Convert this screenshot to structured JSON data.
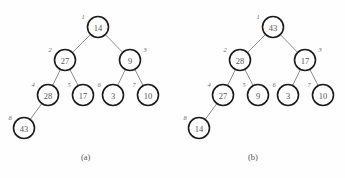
{
  "figure": {
    "background_color": "#fefefe",
    "node_fill": "#fdfdfd",
    "node_stroke": "#1c1c1c",
    "edge_color": "#8e8e8e",
    "value_color": "#585858",
    "index_color": "#6a6a6a"
  },
  "panels": [
    {
      "caption": "(a)",
      "caption_x": 81,
      "caption_y": 152,
      "nodes": [
        {
          "index": "1",
          "value": "14",
          "cx": 98,
          "cy": 27,
          "r": 10.5,
          "ix": 83,
          "iy": 16
        },
        {
          "index": "2",
          "value": "27",
          "cx": 65,
          "cy": 60,
          "r": 10.5,
          "ix": 50,
          "iy": 49
        },
        {
          "index": "3",
          "value": "9",
          "cx": 130,
          "cy": 60,
          "r": 10.5,
          "ix": 145,
          "iy": 49
        },
        {
          "index": "4",
          "value": "28",
          "cx": 48,
          "cy": 95,
          "r": 10.5,
          "ix": 33,
          "iy": 84
        },
        {
          "index": "5",
          "value": "17",
          "cx": 83,
          "cy": 95,
          "r": 10.5,
          "ix": 69,
          "iy": 84
        },
        {
          "index": "6",
          "value": "3",
          "cx": 113,
          "cy": 95,
          "r": 10.5,
          "ix": 99,
          "iy": 84
        },
        {
          "index": "7",
          "value": "10",
          "cx": 148,
          "cy": 95,
          "r": 10.5,
          "ix": 134,
          "iy": 84
        },
        {
          "index": "8",
          "value": "43",
          "cx": 24,
          "cy": 128,
          "r": 10.5,
          "ix": 10,
          "iy": 117
        }
      ],
      "edges": [
        {
          "x1": 98,
          "y1": 27,
          "x2": 65,
          "y2": 60
        },
        {
          "x1": 98,
          "y1": 27,
          "x2": 130,
          "y2": 60
        },
        {
          "x1": 65,
          "y1": 60,
          "x2": 48,
          "y2": 95
        },
        {
          "x1": 65,
          "y1": 60,
          "x2": 83,
          "y2": 95
        },
        {
          "x1": 130,
          "y1": 60,
          "x2": 113,
          "y2": 95
        },
        {
          "x1": 130,
          "y1": 60,
          "x2": 148,
          "y2": 95
        },
        {
          "x1": 48,
          "y1": 95,
          "x2": 24,
          "y2": 128
        }
      ]
    },
    {
      "caption": "(b)",
      "caption_x": 248,
      "caption_y": 152,
      "nodes": [
        {
          "index": "1",
          "value": "43",
          "cx": 273,
          "cy": 27,
          "r": 10.5,
          "ix": 258,
          "iy": 16
        },
        {
          "index": "2",
          "value": "28",
          "cx": 240,
          "cy": 60,
          "r": 10.5,
          "ix": 225,
          "iy": 49
        },
        {
          "index": "3",
          "value": "17",
          "cx": 305,
          "cy": 60,
          "r": 10.5,
          "ix": 320,
          "iy": 49
        },
        {
          "index": "4",
          "value": "27",
          "cx": 223,
          "cy": 95,
          "r": 10.5,
          "ix": 209,
          "iy": 84
        },
        {
          "index": "5",
          "value": "9",
          "cx": 258,
          "cy": 95,
          "r": 10.5,
          "ix": 244,
          "iy": 84
        },
        {
          "index": "6",
          "value": "3",
          "cx": 288,
          "cy": 95,
          "r": 10.5,
          "ix": 274,
          "iy": 84
        },
        {
          "index": "7",
          "value": "10",
          "cx": 323,
          "cy": 95,
          "r": 10.5,
          "ix": 309,
          "iy": 84
        },
        {
          "index": "8",
          "value": "14",
          "cx": 199,
          "cy": 128,
          "r": 10.5,
          "ix": 185,
          "iy": 117
        }
      ],
      "edges": [
        {
          "x1": 273,
          "y1": 27,
          "x2": 240,
          "y2": 60
        },
        {
          "x1": 273,
          "y1": 27,
          "x2": 305,
          "y2": 60
        },
        {
          "x1": 240,
          "y1": 60,
          "x2": 223,
          "y2": 95
        },
        {
          "x1": 240,
          "y1": 60,
          "x2": 258,
          "y2": 95
        },
        {
          "x1": 305,
          "y1": 60,
          "x2": 288,
          "y2": 95
        },
        {
          "x1": 305,
          "y1": 60,
          "x2": 323,
          "y2": 95
        },
        {
          "x1": 223,
          "y1": 95,
          "x2": 199,
          "y2": 128
        }
      ]
    }
  ]
}
